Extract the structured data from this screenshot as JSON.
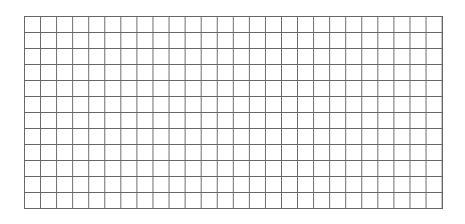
{
  "grid": {
    "columns": 26,
    "rows": 12,
    "line_color": "#666666",
    "background_color": "#ffffff"
  }
}
